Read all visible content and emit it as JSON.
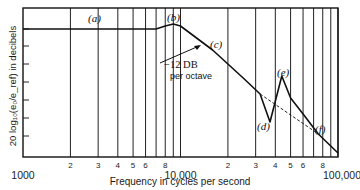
{
  "chart_data": {
    "type": "line",
    "title": "",
    "xlabel": "Frequency in cycles per second",
    "ylabel": "20 log10(e0/eref) in decibels",
    "xscale": "log",
    "xlim": [
      1000,
      100000
    ],
    "x_major_tick_labels": [
      "1000",
      "10,000",
      "100,000"
    ],
    "x_minor_tick_labels": [
      "2",
      "3",
      "4",
      "5",
      "6",
      "8",
      "2",
      "3",
      "4",
      "5",
      "6",
      "8"
    ],
    "grid": "vertical lines at 1-9 multiples of each decade",
    "y_ticks": "unlabeled inward ticks",
    "series": [
      {
        "name": "response",
        "style": "solid",
        "x": [
          1000,
          5000,
          7000,
          8000,
          9000,
          10000,
          16000,
          25000,
          32000,
          37000,
          44000,
          50000,
          60000,
          75000,
          100000
        ],
        "y_px": [
          29,
          29,
          29,
          26,
          24,
          26,
          50,
          78,
          94,
          122,
          76,
          98,
          114,
          134,
          153
        ]
      },
      {
        "name": "asymptote",
        "style": "dashed",
        "x": [
          32000,
          75000
        ],
        "y_px": [
          94,
          134
        ]
      }
    ],
    "annotations": [
      {
        "label": "(a)",
        "x": 2000,
        "region": "flat low-frequency level"
      },
      {
        "label": "(b)",
        "x": 9000,
        "region": "small peak near 9 kc"
      },
      {
        "label": "(c)",
        "x": 17000,
        "region": "-12 dB/octave slope"
      },
      {
        "label": "(d)",
        "x": 37000,
        "region": "notch/dip"
      },
      {
        "label": "(e)",
        "x": 44000,
        "region": "resonant peak"
      },
      {
        "label": "(f)",
        "x": 75000,
        "region": "high-frequency rolloff"
      },
      {
        "label": "−12 DB per octave",
        "x": 13000,
        "region": "slope annotation with arrow"
      }
    ]
  },
  "labels": {
    "ylabel": "20 log₁₀(e₀/e_ref) in decibels",
    "xlabel": "Frequency in cycles per second",
    "x_major": [
      "1000",
      "10,000",
      "100,000"
    ],
    "x_minor": [
      "2",
      "3",
      "4",
      "5",
      "6",
      "8"
    ],
    "annot": {
      "a": "(a)",
      "b": "(b)",
      "c": "(c)",
      "d": "(d)",
      "e": "(e)",
      "f": "(f)",
      "slope_1": "−12 DB",
      "slope_2": "per octave"
    }
  }
}
